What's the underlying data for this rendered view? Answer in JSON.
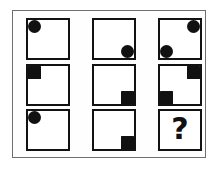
{
  "puzzle": {
    "title": "Matrix Reasoning Puzzle",
    "type": "3x3 progressive matrix",
    "grid_rows": 3,
    "grid_cols": 3,
    "question_mark": "?",
    "colors": {
      "shape_fill": "#111111",
      "cell_border": "#121212",
      "outer_frame": "#6f6f6f",
      "background": "#ffffff"
    },
    "cells": [
      {
        "id": "cell-r1c1",
        "row": 1,
        "col": 1,
        "label": "circle top-left",
        "shapes": [
          {
            "kind": "circle",
            "position": "top-left"
          }
        ]
      },
      {
        "id": "cell-r1c2",
        "row": 1,
        "col": 2,
        "label": "circle bottom-right",
        "shapes": [
          {
            "kind": "circle",
            "position": "bottom-right"
          }
        ]
      },
      {
        "id": "cell-r1c3",
        "row": 1,
        "col": 3,
        "label": "circle top-right and circle bottom-left",
        "shapes": [
          {
            "kind": "circle",
            "position": "top-right"
          },
          {
            "kind": "circle",
            "position": "bottom-left"
          }
        ]
      },
      {
        "id": "cell-r2c1",
        "row": 2,
        "col": 1,
        "label": "square top-left",
        "shapes": [
          {
            "kind": "square",
            "position": "top-left"
          }
        ]
      },
      {
        "id": "cell-r2c2",
        "row": 2,
        "col": 2,
        "label": "square bottom-right",
        "shapes": [
          {
            "kind": "square",
            "position": "bottom-right"
          }
        ]
      },
      {
        "id": "cell-r2c3",
        "row": 2,
        "col": 3,
        "label": "square top-right and square bottom-left",
        "shapes": [
          {
            "kind": "square",
            "position": "top-right"
          },
          {
            "kind": "square",
            "position": "bottom-left"
          }
        ]
      },
      {
        "id": "cell-r3c1",
        "row": 3,
        "col": 1,
        "label": "circle top-left",
        "shapes": [
          {
            "kind": "circle",
            "position": "top-left"
          }
        ]
      },
      {
        "id": "cell-r3c2",
        "row": 3,
        "col": 2,
        "label": "square bottom-right",
        "shapes": [
          {
            "kind": "square",
            "position": "bottom-right"
          }
        ]
      },
      {
        "id": "cell-r3c3",
        "row": 3,
        "col": 3,
        "label": "unknown answer cell",
        "shapes": [],
        "text": "?"
      }
    ]
  }
}
